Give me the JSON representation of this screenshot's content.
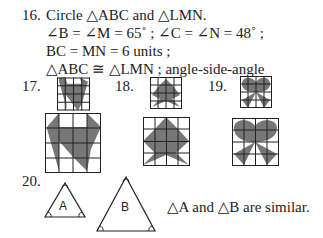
{
  "problem16": {
    "number": "16.",
    "line1": "Circle △ABC and △LMN.",
    "line2": "∠B = ∠M = 65˚ ; ∠C = ∠N = 48˚ ;",
    "line3": "BC = MN = 6 units ;",
    "line4": "△ABC ≅ △LMN ; angle-side-angle"
  },
  "problem17": {
    "number": "17."
  },
  "problem18": {
    "number": "18."
  },
  "problem19": {
    "number": "19."
  },
  "problem20": {
    "number": "20.",
    "triangle_a_label": "A",
    "triangle_b_label": "B",
    "statement": "△A and △B are similar."
  },
  "colors": {
    "shade": "#777777",
    "ink": "#222222"
  }
}
